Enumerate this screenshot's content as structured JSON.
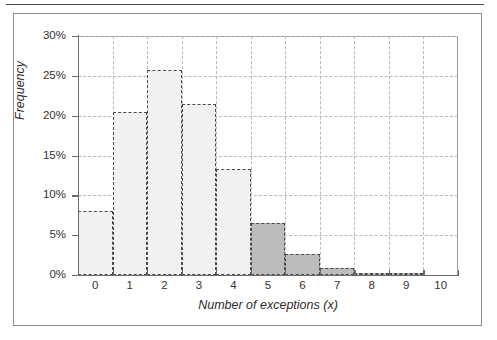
{
  "figure": {
    "frame_visible": true,
    "top_rule_visible": true
  },
  "chart_data": {
    "type": "bar",
    "title": "",
    "subtitle": "",
    "xlabel": "Number of exceptions (x)",
    "ylabel": "Frequency",
    "categories": [
      "0",
      "1",
      "2",
      "3",
      "4",
      "5",
      "6",
      "7",
      "8",
      "9",
      "10"
    ],
    "values": [
      8.0,
      20.4,
      25.7,
      21.5,
      13.3,
      6.5,
      2.7,
      0.9,
      0.3,
      0.05,
      0.0
    ],
    "value_suffix": "%",
    "xlim": [
      -0.5,
      10.5
    ],
    "ylim": [
      0,
      30
    ],
    "y_ticks": [
      0,
      5,
      10,
      15,
      20,
      25,
      30
    ],
    "y_tick_labels": [
      "0%",
      "5%",
      "10%",
      "15%",
      "20%",
      "25%",
      "30%"
    ],
    "x_ticks": [
      0,
      1,
      2,
      3,
      4,
      5,
      6,
      7,
      8,
      9,
      10
    ],
    "x_tick_labels": [
      "0",
      "1",
      "2",
      "3",
      "4",
      "5",
      "6",
      "7",
      "8",
      "9",
      "10"
    ],
    "grid": true,
    "grid_style": "dashed",
    "legend": null,
    "bar_edge_style": "dashed",
    "series_groups": [
      {
        "name": "light",
        "categories": [
          "0",
          "1",
          "2",
          "3",
          "4"
        ],
        "color": "#f1f1f1"
      },
      {
        "name": "dark",
        "categories": [
          "5",
          "6",
          "7",
          "8",
          "9"
        ],
        "color": "#bcbcbc"
      }
    ]
  },
  "colors": {
    "bar_light": "#f1f1f1",
    "bar_dark": "#bcbcbc",
    "bar_edge": "#4b4b4b",
    "grid": "#b9b9b9",
    "axis": "#6b6b6b",
    "text": "#2c2c2c",
    "frame": "#8f8f8f",
    "rule": "#4a4a4a"
  }
}
